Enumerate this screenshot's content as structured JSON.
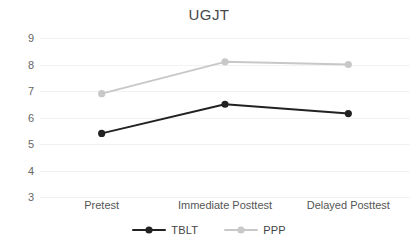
{
  "chart_data": {
    "type": "line",
    "title": "UGJT",
    "xlabel": "",
    "ylabel": "",
    "categories": [
      "Pretest",
      "Immediate Posttest",
      "Delayed Posttest"
    ],
    "series": [
      {
        "name": "TBLT",
        "values": [
          5.4,
          6.5,
          6.15
        ],
        "color": "#222222"
      },
      {
        "name": "PPP",
        "values": [
          6.9,
          8.1,
          8.0
        ],
        "color": "#c8c8c8"
      }
    ],
    "ylim": [
      3,
      9
    ],
    "yticks": [
      9,
      8,
      7,
      6,
      5,
      4,
      3
    ],
    "ytick_labels": [
      "9",
      "8",
      "7",
      "6",
      "5",
      "4",
      "3"
    ],
    "grid": true,
    "grid_color": "#f2f2f2",
    "legend_position": "bottom",
    "markers": "circle",
    "background": "#ffffff"
  },
  "legend": {
    "items": [
      {
        "label": "TBLT",
        "color": "#222222"
      },
      {
        "label": "PPP",
        "color": "#c8c8c8"
      }
    ]
  }
}
